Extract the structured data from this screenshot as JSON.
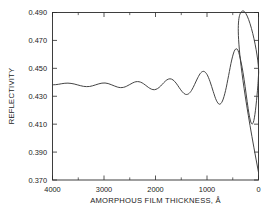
{
  "chart_data": {
    "type": "line",
    "title": "",
    "xlabel": "AMORPHOUS FILM THICKNESS, Å",
    "ylabel": "REFLECTIVITY",
    "xlim": [
      4000,
      0
    ],
    "ylim": [
      0.37,
      0.49
    ],
    "x_reversed": true,
    "grid": false,
    "legend": "none",
    "xticks": [
      4000,
      3000,
      2000,
      1000,
      0
    ],
    "xtick_labels": [
      "4000",
      "3000",
      "2000",
      "1000",
      "0"
    ],
    "x_minor_ticks": [
      3500,
      2500,
      1500,
      500
    ],
    "yticks": [
      0.37,
      0.39,
      0.41,
      0.43,
      0.45,
      0.47,
      0.49
    ],
    "ytick_labels": [
      "0.370",
      "0.390",
      "0.410",
      "0.430",
      "0.450",
      "0.470",
      "0.490"
    ],
    "series": [
      {
        "name": "reflectivity",
        "color": "#3a3a3a",
        "x": [
          4000,
          3940,
          3880,
          3820,
          3760,
          3700,
          3640,
          3580,
          3520,
          3460,
          3400,
          3340,
          3280,
          3220,
          3160,
          3100,
          3040,
          2980,
          2920,
          2860,
          2800,
          2740,
          2680,
          2620,
          2560,
          2500,
          2440,
          2380,
          2320,
          2260,
          2200,
          2140,
          2080,
          2020,
          1960,
          1900,
          1840,
          1780,
          1720,
          1660,
          1600,
          1540,
          1480,
          1420,
          1360,
          1300,
          1240,
          1180,
          1120,
          1060,
          1000,
          940,
          880,
          820,
          760,
          700,
          640,
          580,
          520,
          460,
          400,
          340,
          300,
          260,
          220,
          180,
          140,
          100,
          60,
          20,
          0
        ],
        "y": [
          0.4382,
          0.4383,
          0.4386,
          0.439,
          0.4393,
          0.4394,
          0.4392,
          0.4388,
          0.4382,
          0.4376,
          0.4371,
          0.4369,
          0.437,
          0.4375,
          0.4382,
          0.4389,
          0.4394,
          0.4395,
          0.4391,
          0.4383,
          0.4374,
          0.4366,
          0.4362,
          0.4364,
          0.4372,
          0.4384,
          0.4396,
          0.4404,
          0.4404,
          0.4396,
          0.4381,
          0.4364,
          0.4351,
          0.4347,
          0.4355,
          0.4373,
          0.4397,
          0.4417,
          0.4425,
          0.4417,
          0.4394,
          0.4362,
          0.4332,
          0.4314,
          0.4317,
          0.4342,
          0.4385,
          0.4432,
          0.4468,
          0.4478,
          0.4456,
          0.4404,
          0.4335,
          0.4272,
          0.4243,
          0.4266,
          0.434,
          0.4449,
          0.456,
          0.4631,
          0.463,
          0.4547,
          0.4468,
          0.437,
          0.4262,
          0.4165,
          0.4107,
          0.4113,
          0.4196,
          0.4343,
          0.445
        ],
        "annotations": [
          {
            "x": 300,
            "y": 0.4912,
            "note": "global maximum"
          },
          {
            "x": 0,
            "y": 0.3755,
            "note": "endpoint drop at zero thickness"
          }
        ]
      }
    ]
  },
  "axis": {
    "y_title": "REFLECTIVITY",
    "x_title_text": "AMORPHOUS FILM THICKNESS,",
    "x_title_unit": "Å"
  }
}
